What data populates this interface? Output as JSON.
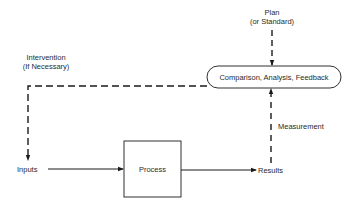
{
  "diagram": {
    "title": "",
    "nodes": {
      "plan": {
        "line1": "Plan",
        "line2": "(or Standard)"
      },
      "comparison": {
        "label": "Comparison, Analysis, Feedback"
      },
      "intervention": {
        "line1": "Intervention",
        "line2": "(If Necessary)"
      },
      "inputs": {
        "label": "Inputs"
      },
      "process": {
        "label": "Process"
      },
      "results": {
        "label": "Results"
      },
      "measurement": {
        "label": "Measurement"
      }
    },
    "edges": [
      {
        "from": "plan",
        "to": "comparison",
        "style": "dashed"
      },
      {
        "from": "comparison",
        "to": "inputs",
        "label": "Intervention (If Necessary)",
        "style": "dashed"
      },
      {
        "from": "inputs",
        "to": "process",
        "style": "solid"
      },
      {
        "from": "process",
        "to": "results",
        "style": "solid"
      },
      {
        "from": "results",
        "to": "comparison",
        "label": "Measurement",
        "style": "dashed"
      }
    ],
    "colors": {
      "line": "#1a1a1a",
      "text": "#2a2a2a",
      "background": "#ffffff"
    }
  }
}
